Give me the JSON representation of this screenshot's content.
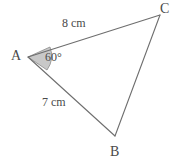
{
  "figure": {
    "type": "triangle-geometry-diagram",
    "background_color": "#ffffff",
    "stroke_color": "#6e6e6e",
    "text_color": "#4a4a4a",
    "angle_fill_color": "#c8c8c8"
  },
  "vertices": {
    "A": {
      "label": "A",
      "x": 28,
      "y": 57
    },
    "B": {
      "label": "B",
      "x": 115,
      "y": 136
    },
    "C": {
      "label": "C",
      "x": 160,
      "y": 15
    }
  },
  "sides": {
    "AC": {
      "label": "8 cm",
      "length": 8,
      "unit": "cm"
    },
    "AB": {
      "label": "7 cm",
      "length": 7,
      "unit": "cm"
    },
    "BC": {
      "label": "",
      "length": null,
      "unit": ""
    }
  },
  "angles": {
    "A": {
      "label": "60°",
      "value": 60,
      "unit": "degrees",
      "marked": true,
      "shaded": true
    }
  }
}
